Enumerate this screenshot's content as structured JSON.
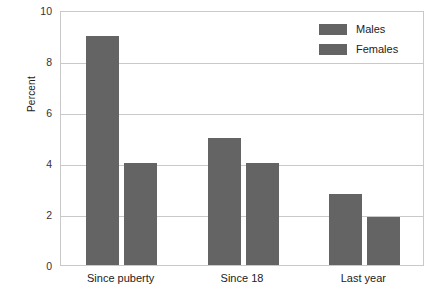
{
  "chart_data": {
    "type": "bar",
    "title": "",
    "xlabel": "",
    "ylabel": "Percent",
    "ylim": [
      0,
      10
    ],
    "yticks": [
      0,
      2,
      4,
      6,
      8,
      10
    ],
    "ytick_labels": [
      "0",
      "2",
      "4",
      "6",
      "8",
      "10"
    ],
    "grid": true,
    "legend_position": "top-right-inside",
    "categories": [
      "Since puberty",
      "Since 18",
      "Last year"
    ],
    "series": [
      {
        "name": "Males",
        "values": [
          9,
          5,
          2.8
        ],
        "color": "#646464"
      },
      {
        "name": "Females",
        "values": [
          4,
          4,
          1.9
        ],
        "color": "#646464"
      }
    ]
  },
  "legend": {
    "items": [
      {
        "label": "Males"
      },
      {
        "label": "Females"
      }
    ]
  },
  "colors": {
    "bar": "#646464",
    "grid": "#c9c9c9",
    "frame": "#c9c9c9",
    "text": "#222222",
    "background": "#ffffff"
  }
}
